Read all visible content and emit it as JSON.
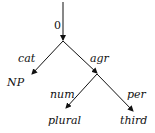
{
  "root_label": "0",
  "edges": {
    "cat": "cat",
    "agr": "agr",
    "num": "num",
    "per": "per"
  },
  "leaves": {
    "np": "NP",
    "plural": "plural",
    "third": "third"
  }
}
